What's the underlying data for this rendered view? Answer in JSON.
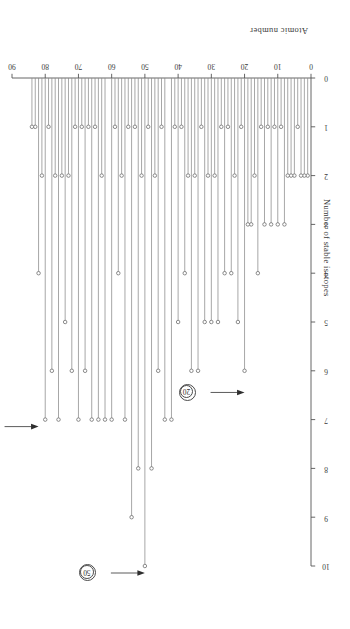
{
  "figure": {
    "orientation_note": "printed-upside-down",
    "x_axis": {
      "label": "Atomic number",
      "ticks": [
        0,
        10,
        20,
        30,
        40,
        50,
        60,
        70,
        80,
        90
      ],
      "tick_labels": [
        "0",
        "10",
        "20",
        "30",
        "40",
        "50",
        "60",
        "70",
        "80",
        "90"
      ],
      "min": 0,
      "max": 90
    },
    "y_axis": {
      "label": "Number of stable isotopes",
      "ticks": [
        0,
        1,
        2,
        3,
        4,
        5,
        6,
        7,
        8,
        9,
        10
      ],
      "tick_labels": [
        "0",
        "1",
        "2",
        "3",
        "4",
        "5",
        "6",
        "7",
        "8",
        "9",
        "10"
      ],
      "min": 0,
      "max": 10
    },
    "annotations": [
      {
        "name": "magic-number-20",
        "label": "20",
        "x": 20,
        "y": 6.3
      },
      {
        "name": "magic-number-50",
        "label": "50",
        "x": 50,
        "y": 10.0
      },
      {
        "name": "magic-number-82",
        "label": "82",
        "x": 82,
        "y": 7.0
      }
    ],
    "colors": {
      "axis": "#555555",
      "stem": "#8a8a8a",
      "marker_edge": "#6e6e6e",
      "text": "#2e2e2e"
    }
  },
  "chart_data": {
    "type": "bar",
    "title": "",
    "subtitle": "",
    "xlabel": "Atomic number",
    "ylabel": "Number of stable isotopes",
    "xlim": [
      0,
      90
    ],
    "ylim": [
      0,
      10
    ],
    "grid": false,
    "legend": null,
    "style": "stem-plot-with-open-circle-markers",
    "x": [
      1,
      2,
      3,
      4,
      5,
      6,
      7,
      8,
      9,
      10,
      11,
      12,
      13,
      14,
      15,
      16,
      17,
      18,
      19,
      20,
      21,
      22,
      23,
      24,
      25,
      26,
      27,
      28,
      29,
      30,
      31,
      32,
      33,
      34,
      35,
      36,
      37,
      38,
      39,
      40,
      41,
      42,
      43,
      44,
      45,
      46,
      47,
      48,
      49,
      50,
      51,
      52,
      53,
      54,
      55,
      56,
      57,
      58,
      59,
      60,
      61,
      62,
      63,
      64,
      65,
      66,
      67,
      68,
      69,
      70,
      71,
      72,
      73,
      74,
      75,
      76,
      77,
      78,
      79,
      80,
      81,
      82,
      83,
      84
    ],
    "values": [
      2,
      2,
      2,
      1,
      2,
      2,
      2,
      3,
      1,
      3,
      1,
      3,
      1,
      3,
      1,
      4,
      2,
      3,
      3,
      6,
      1,
      5,
      2,
      4,
      1,
      4,
      1,
      5,
      2,
      5,
      2,
      5,
      1,
      6,
      2,
      6,
      2,
      4,
      1,
      5,
      1,
      7,
      0,
      7,
      1,
      6,
      2,
      8,
      1,
      10,
      2,
      8,
      1,
      9,
      1,
      7,
      2,
      4,
      1,
      7,
      0,
      7,
      2,
      7,
      1,
      7,
      1,
      6,
      1,
      7,
      1,
      6,
      2,
      5,
      2,
      7,
      2,
      6,
      1,
      7,
      2,
      4,
      1,
      1
    ],
    "annotations": [
      {
        "text": "20",
        "x": 20,
        "note": "magic number",
        "circled": true,
        "arrow": true
      },
      {
        "text": "50",
        "x": 50,
        "note": "magic number",
        "circled": true,
        "arrow": true
      },
      {
        "text": "82",
        "x": 82,
        "note": "magic number",
        "circled": true,
        "arrow": true
      }
    ]
  }
}
